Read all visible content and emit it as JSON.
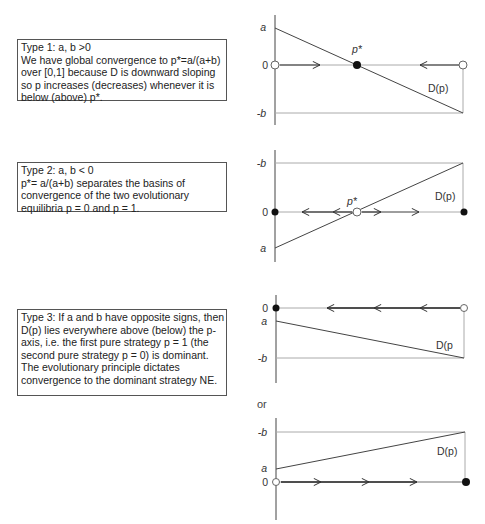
{
  "boxes": [
    {
      "lines": [
        "Type 1:  a, b >0",
        "We have global convergence to p*=a/(a+b)",
        "over [0,1]  because D is downward sloping",
        "so p increases (decreases) whenever it is",
        "below (above) p*."
      ]
    },
    {
      "lines": [
        "Type 2:  a, b < 0",
        "p*= a/(a+b) separates the basins of",
        "convergence of the two evolutionary",
        "equilibria p = 0 and p = 1."
      ]
    },
    {
      "lines": [
        "Type 3:  If a and b have opposite signs, then",
        "D(p) lies everywhere above (below) the p-",
        "axis,  i.e. the first pure strategy p = 1 (the",
        "second pure strategy p = 0) is dominant.",
        "The evolutionary principle dictates",
        "convergence to the   dominant strategy NE."
      ]
    }
  ],
  "or_label": "or",
  "diagrams": [
    {
      "type": "Type 1",
      "y_labels": {
        "top": "a",
        "zero": "0",
        "bottom": "-b"
      },
      "curve_label": "D(p)",
      "pstar_label": "p*",
      "left_endpoint": "open",
      "right_endpoint": "open",
      "pstar_point": "filled",
      "arrows": [
        "right toward p*",
        "left toward p*"
      ]
    },
    {
      "type": "Type 2",
      "y_labels": {
        "top": "-b",
        "zero": "0",
        "bottom": "a"
      },
      "curve_label": "D(p)",
      "pstar_label": "p*",
      "left_endpoint": "filled",
      "right_endpoint": "filled",
      "pstar_point": "open",
      "arrows": [
        "left away from p*",
        "right away from p*"
      ]
    },
    {
      "type": "Type 3a",
      "y_labels": {
        "top": "0",
        "mid": "a",
        "bottom": "-b"
      },
      "curve_label": "D(p",
      "left_endpoint": "filled",
      "right_endpoint": "open",
      "arrows": [
        "left",
        "left",
        "left"
      ]
    },
    {
      "type": "Type 3b",
      "y_labels": {
        "top": "-b",
        "mid": "a",
        "bottom": "0"
      },
      "curve_label": "D(p)",
      "left_endpoint": "open",
      "right_endpoint": "filled",
      "arrows": [
        "right",
        "right",
        "right"
      ]
    }
  ]
}
